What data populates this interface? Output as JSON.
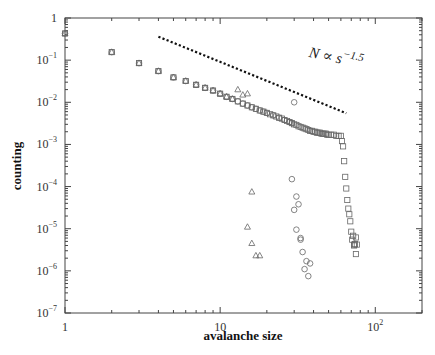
{
  "chart_data": {
    "type": "scatter",
    "title": "",
    "xlabel": "avalanche size",
    "ylabel": "counting",
    "xscale": "log",
    "yscale": "log",
    "xlim": [
      1,
      200
    ],
    "ylim": [
      1e-07,
      1
    ],
    "grid": false,
    "legend": null,
    "x_tick_labels": [
      {
        "value": 1,
        "label": "1"
      },
      {
        "value": 10,
        "label": "10"
      },
      {
        "value": 100,
        "label": "10^2"
      }
    ],
    "y_tick_labels": [
      {
        "value": 1,
        "label": "1"
      },
      {
        "value": 0.1,
        "label": "10^-1"
      },
      {
        "value": 0.01,
        "label": "10^-2"
      },
      {
        "value": 0.001,
        "label": "10^-3"
      },
      {
        "value": 0.0001,
        "label": "10^-4"
      },
      {
        "value": 1e-05,
        "label": "10^-5"
      },
      {
        "value": 1e-06,
        "label": "10^-6"
      },
      {
        "value": 1e-07,
        "label": "10^-7"
      }
    ],
    "annotations": [
      {
        "text": "N ∝ s^-1.5",
        "x": 37,
        "y": 0.12,
        "rotation": 12
      }
    ],
    "reference_line": {
      "style": "dotted",
      "label": "N ∝ s^-1.5",
      "x": [
        4,
        65
      ],
      "y": [
        0.36,
        0.0055
      ]
    },
    "series": [
      {
        "name": "squares",
        "marker": "square",
        "x": [
          1,
          2,
          3,
          4,
          5,
          6,
          7,
          8,
          9,
          10,
          11,
          12,
          13,
          14,
          15,
          16,
          17,
          18,
          19,
          20,
          21,
          22,
          23,
          24,
          25,
          26,
          27,
          28,
          29,
          30,
          31,
          32,
          33,
          34,
          35,
          36,
          37,
          38,
          39,
          40,
          41,
          42,
          43,
          44,
          45,
          46,
          47,
          48,
          49,
          50,
          52,
          54,
          56,
          58,
          60,
          61,
          62,
          63,
          64,
          65,
          66,
          67,
          68,
          69,
          70,
          72,
          75,
          71,
          73,
          73,
          74,
          76,
          75
        ],
        "y": [
          0.43,
          0.155,
          0.085,
          0.055,
          0.039,
          0.032,
          0.026,
          0.022,
          0.019,
          0.016,
          0.0135,
          0.012,
          0.0105,
          0.0093,
          0.0084,
          0.0076,
          0.007,
          0.0064,
          0.006,
          0.0056,
          0.0052,
          0.0049,
          0.0046,
          0.0043,
          0.0041,
          0.0038,
          0.0036,
          0.0034,
          0.0032,
          0.003,
          0.0029,
          0.0027,
          0.0026,
          0.0025,
          0.0024,
          0.0023,
          0.0022,
          0.0021,
          0.0021,
          0.002,
          0.002,
          0.0019,
          0.0019,
          0.0019,
          0.0018,
          0.0018,
          0.0018,
          0.0018,
          0.0017,
          0.0017,
          0.0017,
          0.0017,
          0.0016,
          0.0016,
          0.0016,
          0.0012,
          0.0009,
          0.0004,
          0.00017,
          9e-05,
          4.8e-05,
          3e-05,
          2.2e-05,
          1.5e-05,
          8.5e-06,
          6.8e-06,
          6.2e-06,
          5.5e-06,
          4e-06,
          4.2e-06,
          4.3e-06,
          4.2e-06,
          2.5e-06
        ]
      },
      {
        "name": "circles",
        "marker": "circle",
        "x": [
          1,
          2,
          3,
          4,
          5,
          6,
          7,
          8,
          9,
          10,
          11,
          12,
          13,
          14,
          15,
          16,
          17,
          18,
          19,
          20,
          22,
          24,
          26,
          28,
          29,
          30,
          29,
          31,
          32,
          30,
          31,
          33,
          33,
          34,
          36,
          35,
          37,
          38
        ],
        "y": [
          0.43,
          0.155,
          0.085,
          0.055,
          0.039,
          0.032,
          0.026,
          0.022,
          0.019,
          0.016,
          0.0135,
          0.012,
          0.0105,
          0.0093,
          0.0084,
          0.0076,
          0.007,
          0.0064,
          0.006,
          0.0056,
          0.0049,
          0.0043,
          0.0038,
          0.0034,
          0.0032,
          0.01,
          0.00015,
          5.8e-05,
          3.8e-05,
          2.8e-05,
          9.5e-06,
          6e-06,
          5.5e-06,
          2.8e-06,
          1.7e-06,
          1.1e-06,
          7.5e-07,
          1.5e-06
        ]
      },
      {
        "name": "triangles",
        "marker": "triangle",
        "x": [
          1,
          2,
          3,
          4,
          5,
          6,
          7,
          8,
          9,
          10,
          11,
          12,
          13,
          14,
          15,
          16,
          15,
          16,
          17,
          18
        ],
        "y": [
          0.43,
          0.155,
          0.085,
          0.055,
          0.039,
          0.032,
          0.026,
          0.022,
          0.019,
          0.016,
          0.0135,
          0.012,
          0.02,
          0.015,
          0.016,
          7.5e-05,
          1.1e-05,
          4.5e-06,
          2.3e-06,
          2.3e-06
        ]
      }
    ]
  }
}
